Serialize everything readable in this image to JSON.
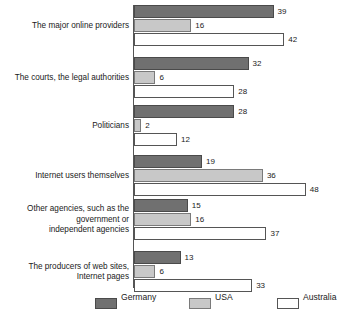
{
  "chart_data": {
    "type": "bar",
    "orientation": "horizontal",
    "title": "",
    "subtitle": "",
    "xlabel": "",
    "ylabel": "",
    "grid": false,
    "legend_position": "bottom",
    "xlim": [
      0,
      48
    ],
    "categories": [
      "The major online providers",
      "The courts, the legal authorities",
      "Politicians",
      "Internet users themselves",
      "Other agencies, such as the\ngovernment or\nindependent agencies",
      "The producers of web sites,\nInternet pages"
    ],
    "series": [
      {
        "name": "Germany",
        "color": "#707070",
        "values": [
          39,
          32,
          28,
          19,
          15,
          13
        ]
      },
      {
        "name": "USA",
        "color": "#c8c8c8",
        "values": [
          16,
          6,
          2,
          36,
          16,
          6
        ]
      },
      {
        "name": "Australia",
        "color": "#ffffff",
        "values": [
          42,
          28,
          12,
          48,
          37,
          33
        ]
      }
    ]
  },
  "legend": {
    "items": [
      {
        "label": "Germany",
        "swatch": "germany"
      },
      {
        "label": "USA",
        "swatch": "usa"
      },
      {
        "label": "Australia",
        "swatch": "australia"
      }
    ]
  },
  "colors": {
    "germany": "#707070",
    "usa": "#c8c8c8",
    "australia": "#ffffff",
    "axis": "#555555",
    "text": "#1a1a1a"
  }
}
